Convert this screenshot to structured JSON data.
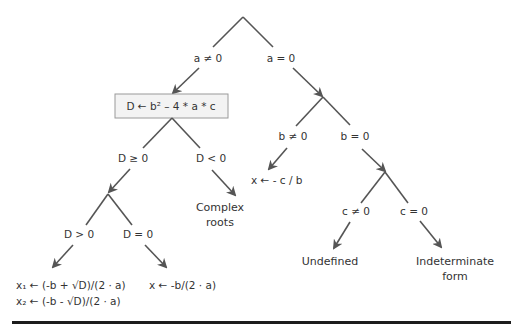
{
  "diagram": {
    "type": "decision-tree",
    "topic": "Solving quadratic equation a*x^2 + b*x + c = 0",
    "colors": {
      "edge": "#555555",
      "text": "#333333",
      "box_fill": "#f3f3f3",
      "box_border": "#9a9a9a",
      "rule": "#1c1c1c"
    },
    "root": {
      "branches": {
        "left_label": "a ≠ 0",
        "right_label": "a = 0"
      }
    },
    "discriminant_box": {
      "text": "D ← b² – 4 * a * c"
    },
    "discriminant_branches": {
      "left_label": "D ≥ 0",
      "right_label": "D < 0"
    },
    "complex_result": {
      "line1": "Complex",
      "line2": "roots"
    },
    "nonneg_branches": {
      "left_label": "D > 0",
      "right_label": "D = 0"
    },
    "two_roots": {
      "line1": "x₁ ← (-b + √D)/(2 · a)",
      "line2": "x₂ ← (-b - √D)/(2 · a)"
    },
    "one_root": {
      "text": "x ← -b/(2 · a)"
    },
    "linear_branches": {
      "left_label": "b ≠ 0",
      "right_label": "b = 0"
    },
    "linear_result": {
      "text": "x ← - c / b"
    },
    "constant_branches": {
      "left_label": "c ≠ 0",
      "right_label": "c = 0"
    },
    "undefined_result": {
      "text": "Undefined"
    },
    "indeterminate_result": {
      "line1": "Indeterminate",
      "line2": "form"
    }
  }
}
